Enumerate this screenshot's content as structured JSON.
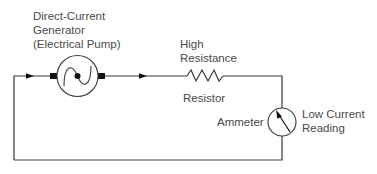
{
  "diagram": {
    "type": "simple-series-circuit",
    "colors": {
      "wire": "#3a3a3a",
      "text": "#4a4a4a",
      "terminal": "#111111",
      "background": "#ffffff"
    },
    "components": {
      "generator": {
        "label_lines": [
          "Direct-Current",
          "Generator",
          "(Electrical Pump)"
        ],
        "symbol": "circle-with-sine-wave"
      },
      "resistor": {
        "label_above_lines": [
          "High",
          "Resistance"
        ],
        "label_below": "Resistor",
        "symbol": "zigzag"
      },
      "ammeter": {
        "label_left": "Ammeter",
        "label_right_lines": [
          "Low Current",
          "Reading"
        ],
        "symbol": "circle-with-needle"
      }
    },
    "current_flow_arrows": [
      {
        "position": "left-top-wire",
        "direction": "right"
      },
      {
        "position": "mid-top-wire",
        "direction": "right"
      }
    ]
  }
}
